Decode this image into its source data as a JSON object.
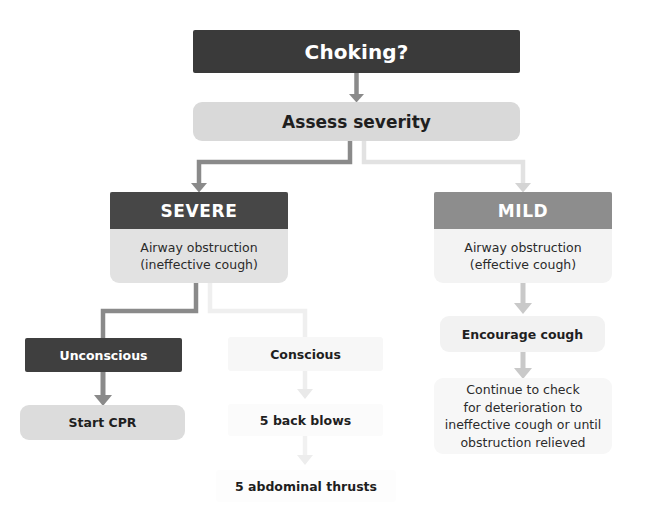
{
  "colors": {
    "dark": "#3a3a3a",
    "dark_header": "#474747",
    "mid_gray": "#8d8d8d",
    "light_gray": "#d9d9d9",
    "pale_gray": "#e2e2e2",
    "near_white": "#f3f3f3",
    "connector_dark": "#8a8a8a",
    "connector_light": "#e6e6e6",
    "text_dark": "#1f1f1f",
    "text_light": "#ffffff",
    "background": "#ffffff"
  },
  "nodes": {
    "choking": {
      "label": "Choking?"
    },
    "assess": {
      "label": "Assess severity"
    },
    "severe": {
      "header": "SEVERE",
      "body": "Airway obstruction\n(ineffective cough)"
    },
    "mild": {
      "header": "MILD",
      "body": "Airway obstruction\n(effective cough)"
    },
    "unconscious": {
      "label": "Unconscious"
    },
    "start_cpr": {
      "label": "Start CPR"
    },
    "conscious": {
      "label": "Conscious"
    },
    "back_blows": {
      "label": "5 back blows"
    },
    "abdominal_thrusts": {
      "label": "5 abdominal thrusts"
    },
    "encourage_cough": {
      "label": "Encourage cough"
    },
    "continue_check": {
      "label": "Continue to check\nfor deterioration to\nineffective cough or until\nobstruction relieved"
    }
  },
  "edges": [
    {
      "from": "choking",
      "to": "assess",
      "style": "dark",
      "shape": "straight-down"
    },
    {
      "from": "assess",
      "to": "severe",
      "style": "dark",
      "shape": "elbow-left"
    },
    {
      "from": "assess",
      "to": "mild",
      "style": "light",
      "shape": "elbow-right"
    },
    {
      "from": "severe",
      "to": "unconscious",
      "style": "dark",
      "shape": "elbow-left"
    },
    {
      "from": "severe",
      "to": "conscious",
      "style": "light",
      "shape": "elbow-right"
    },
    {
      "from": "unconscious",
      "to": "start_cpr",
      "style": "dark",
      "shape": "straight-down"
    },
    {
      "from": "conscious",
      "to": "back_blows",
      "style": "light",
      "shape": "straight-down"
    },
    {
      "from": "back_blows",
      "to": "abdominal_thrusts",
      "style": "light",
      "shape": "straight-down"
    },
    {
      "from": "mild",
      "to": "encourage_cough",
      "style": "mid",
      "shape": "straight-down"
    },
    {
      "from": "encourage_cough",
      "to": "continue_check",
      "style": "mid",
      "shape": "straight-down"
    }
  ]
}
